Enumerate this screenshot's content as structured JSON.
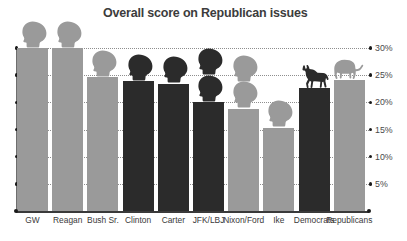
{
  "chart_data": {
    "type": "bar",
    "title": "Overall score on Republican issues",
    "xlabel": "",
    "ylabel": "",
    "ylim": [
      0,
      32
    ],
    "grid": true,
    "legend": "none",
    "ytick_labels": [
      "30%",
      "25%",
      "20%",
      "15%",
      "10%",
      "5%"
    ],
    "ytick_values": [
      30,
      25,
      20,
      15,
      10,
      5
    ],
    "categories": [
      "GW",
      "Reagan",
      "Bush Sr.",
      "Clinton",
      "Carter",
      "JFK/LBJ",
      "Nixon/Ford",
      "Ike",
      "Democrats",
      "Republicans"
    ],
    "values": [
      30.0,
      30.0,
      24.6,
      23.9,
      23.4,
      20.0,
      18.8,
      15.3,
      22.7,
      24.1
    ],
    "party": [
      "rep",
      "rep",
      "rep",
      "dem",
      "dem",
      "dem",
      "rep",
      "rep",
      "dem",
      "rep"
    ],
    "icons": [
      "head",
      "head",
      "head",
      "head",
      "head",
      "head-double",
      "head-double",
      "head",
      "donkey",
      "elephant"
    ],
    "colors": {
      "republican_bar": "#9a9a9a",
      "democrat_bar": "#2b2b2b",
      "title_text": "#3c3c3c",
      "axis": "#3a3a3a",
      "gridline": "#8e8e8e",
      "label_text": "#3a3a3a"
    }
  }
}
